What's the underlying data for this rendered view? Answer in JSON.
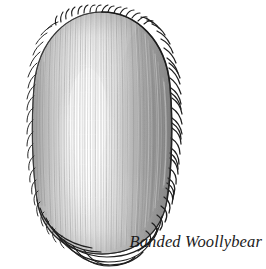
{
  "figure": {
    "caption": "Banded Woollybear",
    "view": "dorsal",
    "medium": "pencil-and-ink line drawing",
    "background_color": "#ffffff",
    "palette": {
      "outline": "#1a1a1a",
      "bristle": "#262626",
      "body_mid_gray": "#a6a6a6",
      "body_light_gray": "#cfcfcf",
      "body_highlight": "#fbfbfb",
      "body_shadow": "#8a8a8a",
      "caption_color": "#1b1b1b"
    },
    "body": {
      "shape": "elongated rounded oval",
      "center_x": 102,
      "center_y": 133,
      "width": 139,
      "height": 243,
      "top": 12,
      "bottom": 255,
      "left": 33,
      "right": 172
    },
    "highlight": {
      "center_x": 86,
      "center_y": 140,
      "width": 52,
      "height": 150
    },
    "bristles": {
      "right_count": 30,
      "left_count": 22,
      "top_count": 16,
      "bottom_count": 9,
      "length_px": 9
    },
    "hair_strokes": {
      "count": 150,
      "direction": "vertical",
      "note": "fine vertical striations following body contour"
    }
  }
}
